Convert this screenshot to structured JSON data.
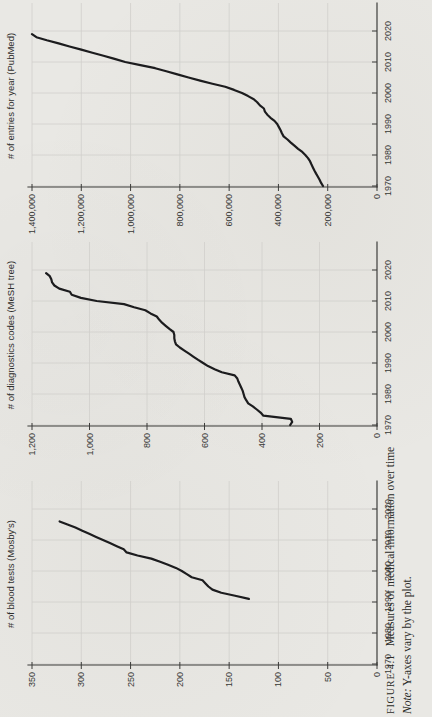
{
  "caption": {
    "figure_label": "FIGURE 4.1",
    "figure_title": "Measures of medical information over time",
    "note_label": "Note:",
    "note_text": "Y-axes vary by the plot."
  },
  "chart_data": [
    {
      "type": "line",
      "title": "# of entries for year (PubMed)",
      "xlabel": "",
      "ylabel": "# of entries for year (PubMed)",
      "grid": true,
      "legend": "none",
      "xlim": [
        1970,
        2027
      ],
      "ylim": [
        0,
        1400000
      ],
      "xticks": [
        1970,
        1980,
        1990,
        2000,
        2010,
        2020
      ],
      "y_step": 200000,
      "ytick_labels": [
        "0",
        "200,000",
        "400,000",
        "600,000",
        "800,000",
        "1,000,000",
        "1,200,000",
        "1,400,000"
      ],
      "x": [
        1970,
        1971,
        1972,
        1973,
        1974,
        1975,
        1976,
        1977,
        1978,
        1979,
        1980,
        1981,
        1982,
        1983,
        1984,
        1985,
        1986,
        1987,
        1988,
        1989,
        1990,
        1991,
        1992,
        1993,
        1994,
        1995,
        1996,
        1997,
        1998,
        1999,
        2000,
        2001,
        2002,
        2003,
        2004,
        2005,
        2006,
        2007,
        2008,
        2009,
        2010,
        2011,
        2012,
        2013,
        2014,
        2015,
        2016,
        2017,
        2018,
        2019
      ],
      "y": [
        219000,
        227000,
        233000,
        240000,
        247000,
        254000,
        260000,
        266000,
        272000,
        280000,
        291000,
        303000,
        320000,
        335000,
        350000,
        363000,
        379000,
        386000,
        391000,
        398000,
        405000,
        416000,
        432000,
        445000,
        455000,
        459000,
        475000,
        486000,
        500000,
        523000,
        548000,
        580000,
        616000,
        668000,
        718000,
        765000,
        810000,
        855000,
        900000,
        960000,
        1022000,
        1065000,
        1110000,
        1155000,
        1200000,
        1248000,
        1292000,
        1340000,
        1382000,
        1400000
      ]
    },
    {
      "type": "line",
      "title": "# of diagnostics codes (MeSH tree)",
      "xlabel": "",
      "ylabel": "# of diagnostics codes (MeSH tree)",
      "grid": true,
      "legend": "none",
      "xlim": [
        1970,
        2027
      ],
      "ylim": [
        0,
        1200
      ],
      "xticks": [
        1970,
        1980,
        1990,
        2000,
        2010,
        2020
      ],
      "y_step": 200,
      "ytick_labels": [
        "0",
        "200",
        "400",
        "600",
        "800",
        "1,000",
        "1,200"
      ],
      "x": [
        1970,
        1971,
        1972,
        1973,
        1974,
        1975,
        1976,
        1977,
        1978,
        1979,
        1980,
        1981,
        1982,
        1983,
        1984,
        1985,
        1986,
        1987,
        1988,
        1989,
        1990,
        1991,
        1992,
        1993,
        1994,
        1995,
        1996,
        1997,
        1998,
        1999,
        2000,
        2001,
        2002,
        2003,
        2004,
        2005,
        2006,
        2007,
        2008,
        2009,
        2010,
        2011,
        2012,
        2013,
        2014,
        2015,
        2016,
        2017,
        2018,
        2019
      ],
      "y": [
        302,
        295,
        300,
        395,
        405,
        418,
        432,
        448,
        455,
        461,
        464,
        467,
        472,
        477,
        482,
        486,
        495,
        540,
        565,
        588,
        605,
        622,
        638,
        654,
        670,
        686,
        699,
        703,
        705,
        705,
        708,
        722,
        735,
        748,
        758,
        766,
        788,
        806,
        845,
        880,
        975,
        1030,
        1062,
        1068,
        1105,
        1122,
        1130,
        1133,
        1138,
        1151
      ]
    },
    {
      "type": "line",
      "title": "# of blood tests (Mosby's)",
      "xlabel": "",
      "ylabel": "# of blood tests (Mosby's)",
      "grid": true,
      "legend": "none",
      "xlim": [
        1970,
        2027
      ],
      "ylim": [
        0,
        350
      ],
      "xticks": [
        1970,
        1980,
        1990,
        2000,
        2010,
        2020
      ],
      "y_step": 50,
      "ytick_labels": [
        "0",
        "50",
        "100",
        "150",
        "200",
        "250",
        "300",
        "350"
      ],
      "x": [
        1991,
        1992,
        1993,
        1994,
        1995,
        1996,
        1997,
        1998,
        1999,
        2000,
        2001,
        2002,
        2003,
        2004,
        2005,
        2006,
        2007,
        2008,
        2009,
        2010,
        2011,
        2012,
        2013,
        2014,
        2015,
        2016
      ],
      "y": [
        130,
        144,
        158,
        167,
        171,
        174,
        177,
        188,
        193,
        198,
        204,
        212,
        220,
        229,
        243,
        254,
        257,
        264,
        271,
        278,
        285,
        292,
        299,
        306,
        314,
        322
      ]
    }
  ],
  "style": {
    "line_color": "#1c1c1e",
    "axis_color": "#3d3d3b",
    "grid_color": "#d0cfcb",
    "label_color": "#383836",
    "page_color": "#e9e8e4"
  }
}
